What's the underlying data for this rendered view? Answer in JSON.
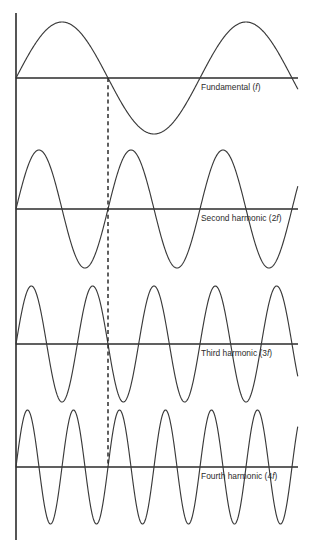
{
  "figure": {
    "background_color": "#ffffff",
    "line_color": "#2b2b2b",
    "curve_color": "#3a3a3a",
    "axis": {
      "vertical_x": 16,
      "vertical_top": 13,
      "vertical_bottom": 540,
      "baseline_start_x": 16,
      "baseline_end_x": 298
    },
    "marker": {
      "name": "phase-reference-dashed-line",
      "x": 108,
      "top_y": 78,
      "bottom_y": 467,
      "dash_pattern": "4 3.2"
    }
  },
  "chart_data": {
    "type": "line",
    "xlabel": "",
    "ylabel": "",
    "grid": false,
    "legend_position": "inline-right",
    "x_range": [
      0,
      2
    ],
    "period_pixels": 184,
    "series": [
      {
        "name": "Fundamental (f)",
        "label_plain": "Fundamental (f)",
        "label_prefix": "Fundamental (",
        "label_italic": "f",
        "label_suffix": ")",
        "harmonic_number": 1,
        "frequency_multiple": "f",
        "cycles_shown": 1.53,
        "baseline_y": 78,
        "amplitude_px": 56,
        "label_x": 201,
        "label_y": 90,
        "start_x": 16,
        "end_x": 298
      },
      {
        "name": "Second harmonic (2f)",
        "label_plain": "Second harmonic (2f)",
        "label_prefix": "Second harmonic (2",
        "label_italic": "f",
        "label_suffix": ")",
        "harmonic_number": 2,
        "frequency_multiple": "2f",
        "cycles_shown": 3.06,
        "baseline_y": 209,
        "amplitude_px": 59,
        "label_x": 201,
        "label_y": 221,
        "start_x": 16,
        "end_x": 298
      },
      {
        "name": "Third harmonic (3f)",
        "label_plain": "Third harmonic (3f)",
        "label_prefix": "Third harmonic (3",
        "label_italic": "f",
        "label_suffix": ")",
        "harmonic_number": 3,
        "frequency_multiple": "3f",
        "cycles_shown": 4.59,
        "baseline_y": 344,
        "amplitude_px": 58,
        "label_x": 201,
        "label_y": 356,
        "start_x": 16,
        "end_x": 298
      },
      {
        "name": "Fourth harmonic (4f)",
        "label_plain": "Fourth harmonic (4f)",
        "label_prefix": "Fourth harmonic (4",
        "label_italic": "f",
        "label_suffix": ")",
        "harmonic_number": 4,
        "frequency_multiple": "4f",
        "cycles_shown": 6.12,
        "baseline_y": 467,
        "amplitude_px": 57,
        "label_x": 201,
        "label_y": 479,
        "start_x": 16,
        "end_x": 298
      }
    ]
  }
}
